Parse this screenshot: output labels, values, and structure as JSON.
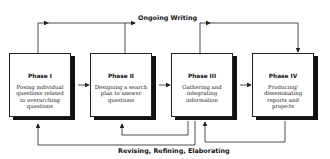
{
  "diagram": {
    "top_loop_label": "Ongoing Writing",
    "bottom_loop_label": "Revising, Refining, Elaborating",
    "phases": [
      {
        "title": "Phase I",
        "description": "Posing individual questions related to overarching questions"
      },
      {
        "title": "Phase II",
        "description": "Designing a search plan to answer questions"
      },
      {
        "title": "Phase III",
        "description": "Gathering and integrating information"
      },
      {
        "title": "Phase IV",
        "description": "Producing/ disseminating reports and projects"
      }
    ],
    "colors": {
      "line": "#222222",
      "shadow": "#111111",
      "background": "#ffffff"
    }
  }
}
